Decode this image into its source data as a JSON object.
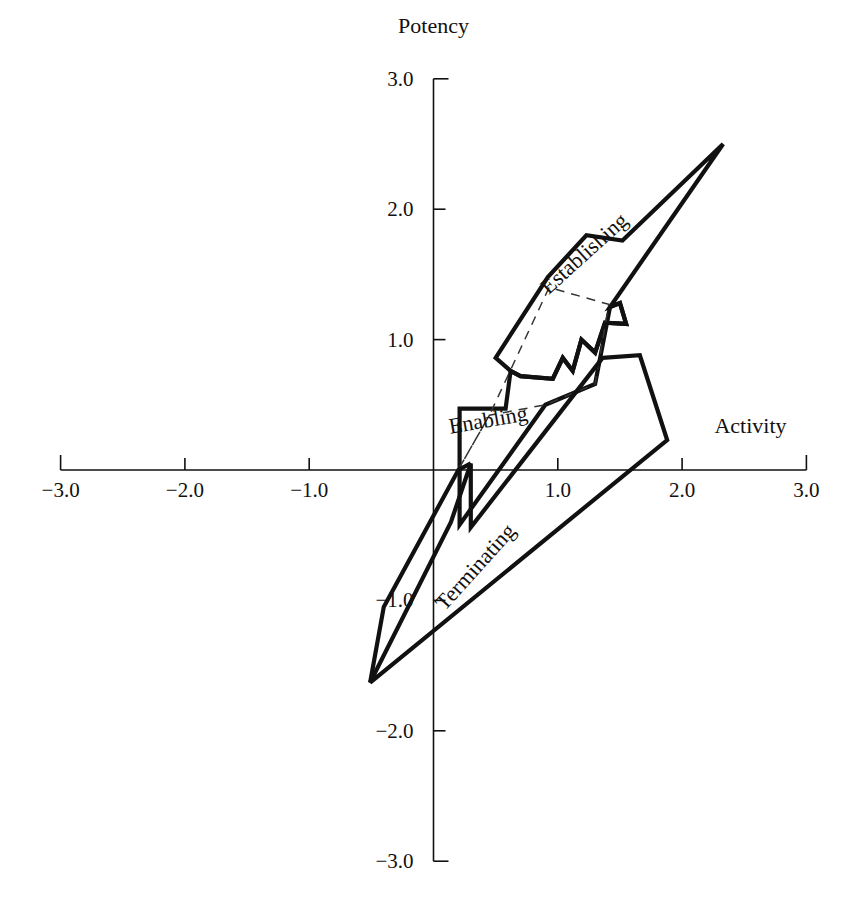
{
  "chart_data": {
    "type": "scatter",
    "title": "",
    "subtitle": "",
    "xlabel": "Activity",
    "ylabel": "Potency",
    "xlim": [
      -3.0,
      3.0
    ],
    "ylim": [
      -3.0,
      3.0
    ],
    "grid": false,
    "legend_position": "inline-labels",
    "x_ticks": [
      -3.0,
      -2.0,
      -1.0,
      1.0,
      2.0,
      3.0
    ],
    "x_tick_labels": [
      "−3.0",
      "−2.0",
      "−1.0",
      "1.0",
      "2.0",
      "3.0"
    ],
    "y_ticks": [
      3.0,
      2.0,
      1.0,
      -1.0,
      -2.0,
      -3.0
    ],
    "y_tick_labels": [
      "3.0",
      "2.0",
      "1.0",
      "−1.0",
      "−2.0",
      "−3.0"
    ],
    "annotations": [
      {
        "text": "Potency",
        "x": 0.0,
        "y": 3.35,
        "rotation": 0
      },
      {
        "text": "Activity",
        "x": 2.55,
        "y": 0.28,
        "rotation": 0
      },
      {
        "text": "Establishing",
        "x": 1.25,
        "y": 1.62,
        "rotation": -42
      },
      {
        "text": "Enabling",
        "x": 0.45,
        "y": 0.33,
        "rotation": -10
      },
      {
        "text": "Terminating",
        "x": 0.38,
        "y": -0.78,
        "rotation": -48
      }
    ],
    "series": [
      {
        "name": "Establishing",
        "style": "solid-outline",
        "closed": true,
        "points": [
          [
            0.62,
            0.76
          ],
          [
            0.5,
            0.86
          ],
          [
            0.92,
            1.48
          ],
          [
            1.23,
            1.8
          ],
          [
            1.52,
            1.76
          ],
          [
            2.33,
            2.5
          ],
          [
            1.42,
            1.25
          ],
          [
            1.5,
            1.28
          ],
          [
            1.55,
            1.12
          ],
          [
            1.38,
            1.13
          ],
          [
            1.3,
            0.9
          ],
          [
            1.19,
            1.0
          ],
          [
            1.12,
            0.76
          ],
          [
            1.04,
            0.86
          ],
          [
            0.96,
            0.7
          ],
          [
            0.7,
            0.72
          ]
        ]
      },
      {
        "name": "Enabling",
        "style": "solid-outline",
        "closed": true,
        "points": [
          [
            0.21,
            0.47
          ],
          [
            0.58,
            0.47
          ],
          [
            0.62,
            0.76
          ],
          [
            0.7,
            0.72
          ],
          [
            0.96,
            0.7
          ],
          [
            1.04,
            0.86
          ],
          [
            1.12,
            0.76
          ],
          [
            1.19,
            1.0
          ],
          [
            1.3,
            0.9
          ],
          [
            1.38,
            1.13
          ],
          [
            1.55,
            1.12
          ],
          [
            1.5,
            1.28
          ],
          [
            1.42,
            1.25
          ],
          [
            1.3,
            0.66
          ],
          [
            0.9,
            0.5
          ],
          [
            0.21,
            -0.42
          ]
        ]
      },
      {
        "name": "Enabling-inner-dashed",
        "style": "dashed",
        "closed": true,
        "points": [
          [
            0.21,
            0.02
          ],
          [
            0.45,
            0.42
          ],
          [
            0.93,
            1.4
          ],
          [
            1.41,
            1.27
          ],
          [
            1.3,
            0.66
          ],
          [
            0.9,
            0.5
          ],
          [
            0.45,
            0.42
          ]
        ]
      },
      {
        "name": "Terminating",
        "style": "solid-outline",
        "closed": true,
        "points": [
          [
            1.36,
            0.86
          ],
          [
            1.66,
            0.88
          ],
          [
            1.88,
            0.23
          ],
          [
            -0.51,
            -1.63
          ],
          [
            0.14,
            -0.4
          ],
          [
            0.3,
            0.05
          ],
          [
            0.3,
            -0.44
          ],
          [
            1.36,
            0.86
          ]
        ]
      },
      {
        "name": "Terminating-tail",
        "style": "solid-outline",
        "closed": false,
        "points": [
          [
            -0.51,
            -1.63
          ],
          [
            -0.4,
            -1.05
          ],
          [
            0.2,
            0.0
          ],
          [
            0.3,
            0.05
          ]
        ]
      }
    ]
  }
}
